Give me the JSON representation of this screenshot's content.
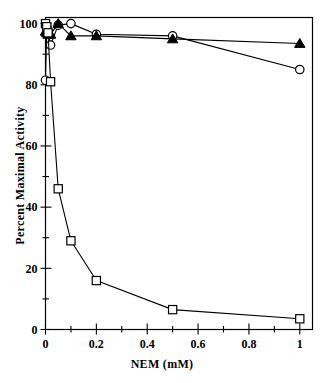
{
  "figure": {
    "background": "#ffffff",
    "frame_color": "#000000",
    "series_color": "#000000"
  },
  "chart_data": {
    "type": "line",
    "title": "",
    "subtitle": "",
    "xlabel": "NEM (mM)",
    "ylabel": "Percent Maximal Activity",
    "xlim": [
      0,
      1.05
    ],
    "ylim": [
      0,
      102
    ],
    "xticks": [
      0,
      0.2,
      0.4,
      0.6,
      0.8,
      1
    ],
    "xticklabels": [
      "0",
      "0.2",
      "0.4",
      "0.6",
      "0.8",
      "1"
    ],
    "yticks": [
      0,
      20,
      40,
      60,
      80,
      100
    ],
    "yticklabels": [
      "0",
      "20",
      "40",
      "60",
      "80",
      "100"
    ],
    "x_minor_ticks": [
      0.1,
      0.3,
      0.5,
      0.7,
      0.9
    ],
    "y_minor_ticks": [
      10,
      30,
      50,
      70,
      90
    ],
    "grid": false,
    "legend": false,
    "legend_position": "none",
    "annotations": [],
    "series": [
      {
        "name": "open-circle-series",
        "marker": "open-circle",
        "marker_filled": false,
        "x": [
          0.0,
          0.005,
          0.01,
          0.02,
          0.05,
          0.1,
          0.2,
          0.5,
          1.0
        ],
        "values": [
          81.5,
          99.0,
          97.5,
          93.0,
          99.5,
          100.0,
          96.5,
          96.0,
          85.0
        ]
      },
      {
        "name": "filled-triangle-series",
        "marker": "filled-triangle",
        "marker_filled": true,
        "x": [
          0.0,
          0.005,
          0.01,
          0.02,
          0.05,
          0.1,
          0.2,
          0.5,
          1.0
        ],
        "values": [
          97.5,
          97.0,
          96.5,
          96.5,
          100.0,
          96.0,
          96.0,
          95.0,
          93.5
        ]
      },
      {
        "name": "open-square-series",
        "marker": "open-square",
        "marker_filled": false,
        "x": [
          0.0,
          0.005,
          0.01,
          0.02,
          0.05,
          0.1,
          0.2,
          0.5,
          1.0
        ],
        "values": [
          100.0,
          99.0,
          97.0,
          81.0,
          46.0,
          29.0,
          16.0,
          6.5,
          3.5
        ]
      }
    ]
  }
}
